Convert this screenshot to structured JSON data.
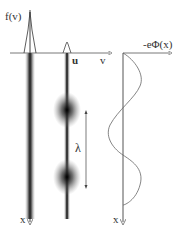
{
  "labels": {
    "f_of_v": "f(v)",
    "v_axis": "v",
    "u_label": "u",
    "potential": "-eΦ(x)",
    "lambda": "λ",
    "x_left": "x",
    "x_right": "x"
  },
  "colors": {
    "beam": "#1a1a1a",
    "axis": "#555555",
    "curve": "#666666",
    "background": "#ffffff"
  }
}
